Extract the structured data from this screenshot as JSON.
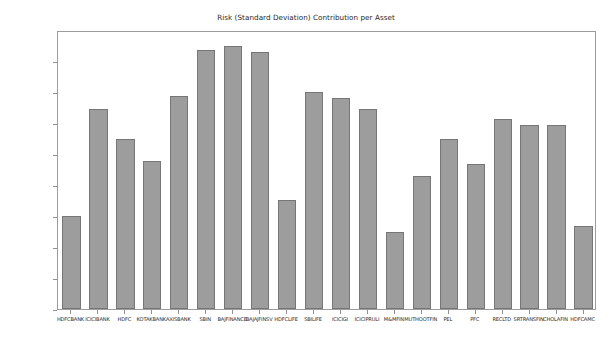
{
  "chart_data": {
    "type": "bar",
    "title": "Risk (Standard Deviation) Contribution per Asset",
    "xlabel": "",
    "ylabel": "",
    "ylim": [
      0,
      2.25
    ],
    "grid": false,
    "legend": null,
    "y_tick_labels": [
      "2.2500%",
      "2.0000%",
      "1.7500%",
      "1.5000%",
      "1.2500%",
      "1.0000%",
      "0.7500%",
      "0.5000%",
      "0.2500%",
      "0.0000%"
    ],
    "y_tick_values": [
      2.25,
      2.0,
      1.75,
      1.5,
      1.25,
      1.0,
      0.75,
      0.5,
      0.25,
      0.0
    ],
    "units": "percent",
    "categories": [
      "HDFCBANK",
      "ICICIBANK",
      "HDFC",
      "KOTAKBANK",
      "AXISBANK",
      "SBIN",
      "BAJFINANCE",
      "BAJAJFINSV",
      "HDFCLIFE",
      "SBILIFE",
      "ICICIGI",
      "ICICIPRULI",
      "M&MFIN",
      "MUTHOOTFIN",
      "PEL",
      "PFC",
      "RECLTD",
      "SRTRANSFIN",
      "CHOLAFIN",
      "HDFCAMC"
    ],
    "values": [
      0.75,
      1.61,
      1.375,
      1.19,
      1.72,
      2.09,
      2.12,
      2.07,
      0.88,
      1.75,
      1.7,
      1.61,
      0.62,
      1.07,
      1.375,
      1.17,
      1.53,
      1.48,
      1.48,
      0.67
    ],
    "bar_color": "#9d9d9d",
    "bar_edge_color": "#767676",
    "axes_edge_color": "#9c9c9c",
    "background_color": "#ffffff"
  }
}
